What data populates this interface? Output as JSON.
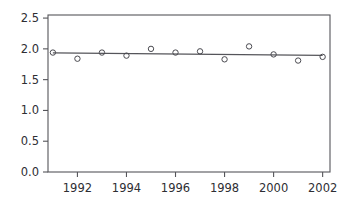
{
  "chart_data": {
    "type": "scatter",
    "title": "",
    "subtitle": "",
    "xlabel": "",
    "ylabel": "",
    "x": [
      1991,
      1992,
      1993,
      1994,
      1995,
      1996,
      1997,
      1998,
      1999,
      2000,
      2001,
      2002
    ],
    "values": [
      1.94,
      1.84,
      1.94,
      1.89,
      2.0,
      1.94,
      1.96,
      1.83,
      2.04,
      1.91,
      1.81,
      1.87
    ],
    "series": [
      {
        "name": "observations",
        "marker": "open-circle",
        "values": [
          1.94,
          1.84,
          1.94,
          1.89,
          2.0,
          1.94,
          1.96,
          1.83,
          2.04,
          1.91,
          1.81,
          1.87
        ]
      },
      {
        "name": "trend-line",
        "type": "line",
        "x": [
          1991,
          2002
        ],
        "values": [
          1.935,
          1.895
        ]
      }
    ],
    "xlim": [
      1990.8,
      2002.3
    ],
    "ylim": [
      0.0,
      2.55
    ],
    "xticks": [
      1992,
      1994,
      1996,
      1998,
      2000,
      2002
    ],
    "xticklabels": [
      "1992",
      "1994",
      "1996",
      "1998",
      "2000",
      "2002"
    ],
    "yticks": [
      0.0,
      0.5,
      1.0,
      1.5,
      2.0,
      2.5
    ],
    "yticklabels": [
      "0.0",
      "0.5",
      "1.0",
      "1.5",
      "2.0",
      "2.5"
    ],
    "grid": false,
    "legend": "none",
    "annotations": [],
    "colors": {
      "axis": "#55555a",
      "marker": "#4a4a50",
      "trend": "#55555a",
      "text": "#2e2e33",
      "background": "#ffffff"
    }
  },
  "figure": {
    "background_color": "#ffffff",
    "plot_left_px": 48,
    "plot_right_px": 330,
    "plot_top_px": 15,
    "plot_bottom_px": 172
  }
}
